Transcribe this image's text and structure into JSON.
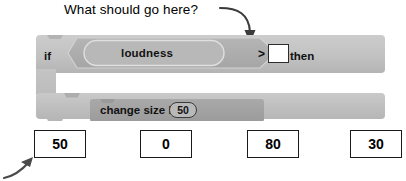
{
  "annotation": {
    "question": "What should go here?",
    "callout_arrow_icon": "curved-arrow-down-icon",
    "bottom_arrow_icon": "arrow-up-right-icon"
  },
  "script": {
    "if_block": {
      "if_label": "if",
      "then_label": "then",
      "condition": {
        "left_operand": "loudness",
        "operator": ">",
        "right_operand": ""
      },
      "body": [
        {
          "label": "change  size  by",
          "value": "50"
        }
      ]
    }
  },
  "answers": {
    "options": [
      {
        "value": "50"
      },
      {
        "value": "0"
      },
      {
        "value": "80"
      },
      {
        "value": "30"
      }
    ]
  },
  "colors": {
    "block_light": "#c6c6c6",
    "block_mid": "#b0b0b0",
    "block_dark": "#a0a0a0",
    "outline": "#2c2c2c",
    "text": "#111111",
    "input_fill": "#ffffff"
  }
}
